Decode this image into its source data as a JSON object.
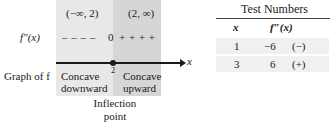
{
  "sign_chart": {
    "intervals": [
      {
        "label": "(−∞, 2)",
        "shade": "#e8e8e8"
      },
      {
        "label": "(2, ∞)",
        "shade": "#d6d6d6"
      }
    ],
    "row_labels": {
      "second_derivative": "f″(x)",
      "graph": "Graph of f"
    },
    "signs": {
      "negative": "– – – –",
      "zero": "0",
      "positive": "+ + + +"
    },
    "axis": {
      "variable": "x",
      "critical_value": "2"
    },
    "concavity": [
      {
        "line1": "Concave",
        "line2": "downward"
      },
      {
        "line1": "Concave",
        "line2": "upward"
      }
    ],
    "inflection_label": {
      "line1": "Inflection",
      "line2": "point"
    }
  },
  "test_table": {
    "title": "Test Numbers",
    "columns": [
      "x",
      "f″(x)"
    ],
    "rows": [
      {
        "x": "1",
        "value": "−6",
        "sign": "(−)"
      },
      {
        "x": "3",
        "value": "6",
        "sign": "(+)"
      }
    ]
  },
  "colors": {
    "left_region": "#e8e8e8",
    "right_region": "#d6d6d6",
    "table_row_shade": "#f0f0f0",
    "ink": "#1a1a1a"
  }
}
